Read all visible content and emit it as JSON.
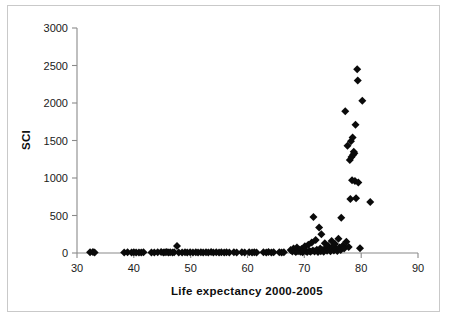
{
  "figure": {
    "background_color": "#ffffff",
    "frame_color": "#c9c9c9",
    "marker_color": "#0a0a0a",
    "axis_color": "#8a8a8a"
  },
  "axes": {
    "x_title": "Life expectancy 2000-2005",
    "y_title": "SCI",
    "x_ticks": [
      "30",
      "40",
      "50",
      "60",
      "70",
      "80",
      "90"
    ],
    "y_ticks": [
      "0",
      "500",
      "1000",
      "1500",
      "2000",
      "2500",
      "3000"
    ]
  },
  "chart_data": {
    "type": "scatter",
    "title": "",
    "xlabel": "Life expectancy 2000-2005",
    "ylabel": "SCI",
    "xlim": [
      30,
      90
    ],
    "ylim": [
      0,
      3000
    ],
    "xticks": [
      30,
      40,
      50,
      60,
      70,
      80,
      90
    ],
    "yticks": [
      0,
      500,
      1000,
      1500,
      2000,
      2500,
      3000
    ],
    "grid": false,
    "legend": null,
    "marker": "diamond",
    "marker_color": "#0a0a0a",
    "series": [
      {
        "name": "Countries",
        "points": [
          [
            32.3,
            10
          ],
          [
            32.8,
            12
          ],
          [
            33.1,
            8
          ],
          [
            38.3,
            6
          ],
          [
            38.9,
            9
          ],
          [
            39.6,
            7
          ],
          [
            40.0,
            10
          ],
          [
            40.4,
            6
          ],
          [
            40.9,
            8
          ],
          [
            41.3,
            7
          ],
          [
            41.7,
            9
          ],
          [
            43.1,
            8
          ],
          [
            43.6,
            6
          ],
          [
            44.2,
            10
          ],
          [
            44.8,
            12
          ],
          [
            45.2,
            7
          ],
          [
            45.5,
            9
          ],
          [
            45.8,
            14
          ],
          [
            46.1,
            8
          ],
          [
            46.4,
            10
          ],
          [
            46.8,
            6
          ],
          [
            47.1,
            9
          ],
          [
            47.6,
            95
          ],
          [
            47.9,
            8
          ],
          [
            48.5,
            7
          ],
          [
            49.0,
            10
          ],
          [
            49.4,
            6
          ],
          [
            49.9,
            9
          ],
          [
            50.4,
            8
          ],
          [
            50.9,
            11
          ],
          [
            51.3,
            7
          ],
          [
            51.8,
            9
          ],
          [
            52.2,
            6
          ],
          [
            52.7,
            10
          ],
          [
            53.1,
            8
          ],
          [
            53.6,
            12
          ],
          [
            54.0,
            7
          ],
          [
            54.5,
            9
          ],
          [
            55.0,
            6
          ],
          [
            55.4,
            10
          ],
          [
            55.9,
            8
          ],
          [
            56.3,
            11
          ],
          [
            56.8,
            7
          ],
          [
            57.6,
            9
          ],
          [
            58.1,
            8
          ],
          [
            59.0,
            10
          ],
          [
            59.5,
            6
          ],
          [
            60.3,
            9
          ],
          [
            60.8,
            7
          ],
          [
            61.2,
            11
          ],
          [
            61.6,
            8
          ],
          [
            62.8,
            9
          ],
          [
            63.3,
            7
          ],
          [
            63.7,
            14
          ],
          [
            64.2,
            8
          ],
          [
            64.6,
            10
          ],
          [
            65.6,
            9
          ],
          [
            66.0,
            7
          ],
          [
            66.4,
            11
          ],
          [
            67.6,
            40
          ],
          [
            67.9,
            20
          ],
          [
            68.1,
            60
          ],
          [
            68.3,
            30
          ],
          [
            68.5,
            15
          ],
          [
            68.7,
            75
          ],
          [
            68.9,
            25
          ],
          [
            69.1,
            45
          ],
          [
            69.3,
            18
          ],
          [
            69.5,
            55
          ],
          [
            69.7,
            10
          ],
          [
            69.9,
            35
          ],
          [
            70.1,
            90
          ],
          [
            70.3,
            22
          ],
          [
            70.5,
            12
          ],
          [
            70.7,
            110
          ],
          [
            70.9,
            28
          ],
          [
            71.1,
            16
          ],
          [
            71.3,
            140
          ],
          [
            71.5,
            32
          ],
          [
            71.6,
            480
          ],
          [
            71.8,
            20
          ],
          [
            72.0,
            175
          ],
          [
            72.2,
            45
          ],
          [
            72.4,
            14
          ],
          [
            72.6,
            340
          ],
          [
            72.8,
            60
          ],
          [
            72.9,
            25
          ],
          [
            73.0,
            250
          ],
          [
            73.2,
            38
          ],
          [
            73.4,
            18
          ],
          [
            73.6,
            130
          ],
          [
            73.8,
            70
          ],
          [
            74.0,
            30
          ],
          [
            74.2,
            95
          ],
          [
            74.4,
            48
          ],
          [
            74.6,
            22
          ],
          [
            74.8,
            160
          ],
          [
            75.0,
            85
          ],
          [
            75.2,
            35
          ],
          [
            75.4,
            120
          ],
          [
            75.6,
            55
          ],
          [
            75.8,
            28
          ],
          [
            76.0,
            190
          ],
          [
            76.2,
            72
          ],
          [
            76.4,
            40
          ],
          [
            76.5,
            470
          ],
          [
            76.8,
            100
          ],
          [
            77.0,
            60
          ],
          [
            77.2,
            1890
          ],
          [
            77.4,
            150
          ],
          [
            77.6,
            1430
          ],
          [
            77.8,
            80
          ],
          [
            78.0,
            1240
          ],
          [
            78.1,
            720
          ],
          [
            78.2,
            1490
          ],
          [
            78.3,
            1280
          ],
          [
            78.4,
            970
          ],
          [
            78.5,
            1540
          ],
          [
            78.6,
            1310
          ],
          [
            78.7,
            1350
          ],
          [
            78.8,
            1330
          ],
          [
            78.9,
            960
          ],
          [
            79.0,
            1710
          ],
          [
            79.1,
            730
          ],
          [
            79.3,
            2450
          ],
          [
            79.4,
            2300
          ],
          [
            79.5,
            940
          ],
          [
            79.8,
            65
          ],
          [
            80.2,
            2030
          ],
          [
            81.6,
            680
          ]
        ]
      }
    ]
  }
}
